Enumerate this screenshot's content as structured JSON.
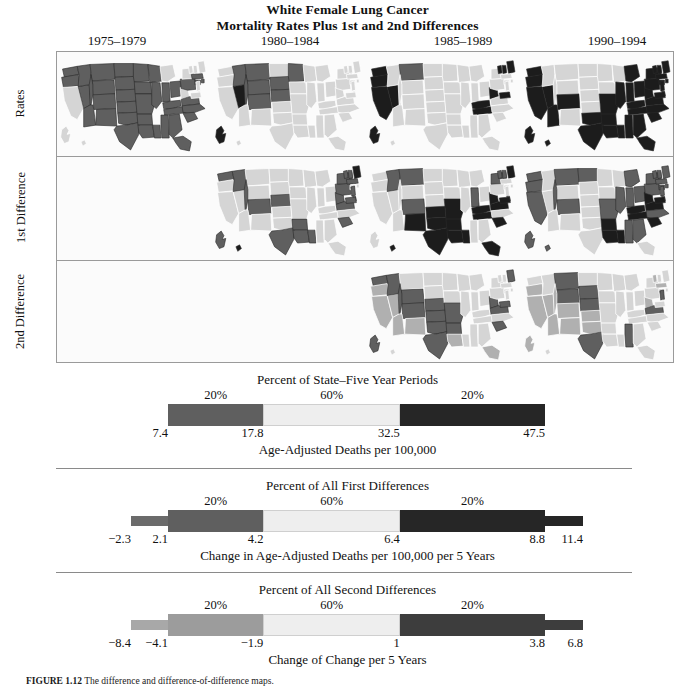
{
  "figure": {
    "title_line1": "White Female Lung Cancer",
    "title_line2": "Mortality Rates Plus 1st and 2nd Differences",
    "caption_label": "FIGURE 1.12",
    "caption_text": "  The difference and difference-of-difference maps."
  },
  "columns": [
    {
      "label": "1975–1979"
    },
    {
      "label": "1980–1984"
    },
    {
      "label": "1985–1989"
    },
    {
      "label": "1990–1994"
    }
  ],
  "rows": [
    {
      "label": "Rates"
    },
    {
      "label": "1st Difference"
    },
    {
      "label": "2nd Difference"
    }
  ],
  "palette": {
    "map_background": "#fbfbfb",
    "panel_border": "#9a9a9a",
    "state_outline": "#ffffff",
    "state_outline_dark": "#2a2a2a",
    "class_very_light": "#e9e9e9",
    "class_light": "#d5d5d5",
    "class_mid_light": "#b0b0b0",
    "class_mid": "#8c8c8c",
    "class_dark": "#5f5f5f",
    "class_very_dark": "#3a3a3a",
    "class_black": "#1c1c1c"
  },
  "legends": [
    {
      "id": "rates",
      "title": "Percent of State–Five Year Periods",
      "footer": "Age-Adjusted Deaths per 100,000",
      "percents": [
        "20%",
        "60%",
        "20%"
      ],
      "ticks": [
        "7.4",
        "17.8",
        "32.5",
        "47.5"
      ],
      "values": [
        7.4,
        17.8,
        32.5,
        47.5
      ],
      "segment_colors": [
        "#5f5f5f",
        "#eeeeee",
        "#262626"
      ],
      "has_tails": false
    },
    {
      "id": "first-difference",
      "title": "Percent of All First Differences",
      "footer": "Change in Age-Adjusted Deaths per 100,000 per 5 Years",
      "percents": [
        "20%",
        "60%",
        "20%"
      ],
      "ticks": [
        "−2.3",
        "2.1",
        "4.2",
        "6.4",
        "8.8",
        "11.4"
      ],
      "values": [
        -2.3,
        2.1,
        4.2,
        6.4,
        8.8,
        11.4
      ],
      "segment_colors": [
        "#5f5f5f",
        "#eeeeee",
        "#262626"
      ],
      "tail_colors": [
        "#6b6b6b",
        "#262626"
      ],
      "has_tails": true
    },
    {
      "id": "second-difference",
      "title": "Percent of All Second Differences",
      "footer": "Change of Change per 5 Years",
      "percents": [
        "20%",
        "60%",
        "20%"
      ],
      "ticks": [
        "−8.4",
        "−4.1",
        "−1.9",
        "1",
        "3.8",
        "6.8"
      ],
      "values": [
        -8.4,
        -4.1,
        -1.9,
        1,
        3.8,
        6.8
      ],
      "segment_colors": [
        "#9c9c9c",
        "#eeeeee",
        "#3d3d3d"
      ],
      "tail_colors": [
        "#a8a8a8",
        "#3d3d3d"
      ],
      "has_tails": true
    }
  ],
  "chart_data": {
    "type": "map",
    "title": "White Female Lung Cancer Mortality Rates Plus 1st and 2nd Differences",
    "grid": {
      "rows": 3,
      "columns": 4
    },
    "row_names": [
      "Rates",
      "1st Difference",
      "2nd Difference"
    ],
    "column_names": [
      "1975–1979",
      "1980–1984",
      "1985–1989",
      "1990–1994"
    ],
    "present_cells": [
      {
        "row": "Rates",
        "columns": [
          "1975–1979",
          "1980–1984",
          "1985–1989",
          "1990–1994"
        ]
      },
      {
        "row": "1st Difference",
        "columns": [
          "1980–1984",
          "1985–1989",
          "1990–1994"
        ]
      },
      {
        "row": "2nd Difference",
        "columns": [
          "1985–1989",
          "1990–1994"
        ]
      }
    ],
    "class_breaks": {
      "rates": [
        7.4,
        17.8,
        32.5,
        47.5
      ],
      "first_difference": [
        -2.3,
        2.1,
        4.2,
        6.4,
        8.8,
        11.4
      ],
      "second_difference": [
        -8.4,
        -4.1,
        -1.9,
        1,
        3.8,
        6.8
      ]
    },
    "class_percentages": [
      20,
      60,
      20
    ],
    "units": {
      "rates": "Age-Adjusted Deaths per 100,000",
      "first_difference": "Change in Age-Adjusted Deaths per 100,000 per 5 Years",
      "second_difference": "Change of Change per 5 Years"
    },
    "shading_levels": [
      0,
      1,
      2,
      3,
      4
    ],
    "maps": [
      {
        "row": 0,
        "col": 0,
        "shades": {
          "WA": 3,
          "OR": 3,
          "CA": 1,
          "NV": 3,
          "ID": 3,
          "MT": 3,
          "WY": 3,
          "UT": 3,
          "CO": 3,
          "AZ": 3,
          "NM": 3,
          "ND": 3,
          "SD": 3,
          "NE": 3,
          "KS": 3,
          "OK": 3,
          "TX": 3,
          "MN": 3,
          "IA": 3,
          "MO": 3,
          "AR": 3,
          "LA": 3,
          "WI": 3,
          "IL": 3,
          "MS": 3,
          "MI": 1,
          "IN": 3,
          "KY": 3,
          "TN": 3,
          "AL": 3,
          "OH": 3,
          "WV": 1,
          "GA": 3,
          "FL": 3,
          "PA": 3,
          "NY": 1,
          "VA": 3,
          "NC": 3,
          "SC": 3,
          "VT": 1,
          "NH": 1,
          "ME": 1,
          "MA": 3,
          "RI": 3,
          "CT": 3,
          "NJ": 1,
          "DE": 1,
          "MD": 1,
          "AK": 1,
          "HI": 1
        }
      },
      {
        "row": 0,
        "col": 1,
        "shades": {
          "WA": 1,
          "OR": 1,
          "CA": 1,
          "NV": 4,
          "ID": 3,
          "MT": 3,
          "WY": 3,
          "UT": 3,
          "CO": 3,
          "AZ": 1,
          "NM": 1,
          "ND": 1,
          "SD": 3,
          "NE": 3,
          "KS": 1,
          "OK": 1,
          "TX": 1,
          "MN": 3,
          "IA": 1,
          "MO": 1,
          "AR": 1,
          "LA": 1,
          "WI": 1,
          "IL": 1,
          "MS": 1,
          "MI": 1,
          "IN": 1,
          "KY": 1,
          "TN": 1,
          "AL": 1,
          "OH": 1,
          "WV": 1,
          "GA": 1,
          "FL": 1,
          "PA": 1,
          "NY": 1,
          "VA": 1,
          "NC": 1,
          "SC": 1,
          "VT": 1,
          "NH": 1,
          "ME": 1,
          "MA": 1,
          "RI": 1,
          "CT": 1,
          "NJ": 1,
          "DE": 1,
          "MD": 1,
          "AK": 4,
          "HI": 1
        }
      },
      {
        "row": 0,
        "col": 2,
        "shades": {
          "WA": 4,
          "OR": 4,
          "CA": 4,
          "NV": 4,
          "ID": 1,
          "MT": 3,
          "WY": 1,
          "UT": 1,
          "CO": 1,
          "AZ": 1,
          "NM": 1,
          "ND": 1,
          "SD": 1,
          "NE": 1,
          "KS": 1,
          "OK": 1,
          "TX": 1,
          "MN": 1,
          "IA": 1,
          "MO": 1,
          "AR": 1,
          "LA": 1,
          "WI": 1,
          "IL": 1,
          "MS": 1,
          "MI": 1,
          "IN": 1,
          "KY": 4,
          "TN": 4,
          "AL": 1,
          "OH": 1,
          "WV": 4,
          "GA": 1,
          "FL": 1,
          "PA": 1,
          "NY": 1,
          "VA": 1,
          "NC": 1,
          "SC": 1,
          "VT": 4,
          "NH": 4,
          "ME": 4,
          "MA": 1,
          "RI": 1,
          "CT": 1,
          "NJ": 1,
          "DE": 1,
          "MD": 4,
          "AK": 4,
          "HI": 1
        }
      },
      {
        "row": 0,
        "col": 3,
        "shades": {
          "WA": 4,
          "OR": 4,
          "CA": 4,
          "NV": 4,
          "ID": 1,
          "MT": 1,
          "WY": 1,
          "UT": 1,
          "CO": 4,
          "AZ": 4,
          "NM": 1,
          "ND": 1,
          "SD": 1,
          "NE": 1,
          "KS": 1,
          "OK": 4,
          "TX": 4,
          "MN": 1,
          "IA": 1,
          "MO": 4,
          "AR": 4,
          "LA": 4,
          "WI": 1,
          "IL": 4,
          "MS": 4,
          "MI": 4,
          "IN": 4,
          "KY": 4,
          "TN": 4,
          "AL": 4,
          "OH": 4,
          "WV": 4,
          "GA": 4,
          "FL": 4,
          "PA": 4,
          "NY": 4,
          "VA": 4,
          "NC": 4,
          "SC": 4,
          "VT": 4,
          "NH": 4,
          "ME": 4,
          "MA": 4,
          "RI": 4,
          "CT": 4,
          "NJ": 4,
          "DE": 4,
          "MD": 4,
          "AK": 4,
          "HI": 4
        }
      },
      {
        "row": 1,
        "col": 1,
        "shades": {
          "WA": 3,
          "OR": 1,
          "CA": 1,
          "NV": 1,
          "ID": 3,
          "MT": 1,
          "WY": 1,
          "UT": 3,
          "CO": 3,
          "AZ": 1,
          "NM": 1,
          "ND": 1,
          "SD": 1,
          "NE": 3,
          "KS": 1,
          "OK": 1,
          "TX": 3,
          "MN": 1,
          "IA": 1,
          "MO": 1,
          "AR": 3,
          "LA": 3,
          "WI": 1,
          "IL": 1,
          "MS": 3,
          "MI": 1,
          "IN": 1,
          "KY": 1,
          "TN": 1,
          "AL": 1,
          "OH": 1,
          "WV": 3,
          "GA": 1,
          "FL": 1,
          "PA": 3,
          "NY": 3,
          "VA": 3,
          "NC": 1,
          "SC": 3,
          "VT": 3,
          "NH": 3,
          "ME": 4,
          "MA": 3,
          "RI": 1,
          "CT": 1,
          "NJ": 3,
          "DE": 3,
          "MD": 3,
          "AK": 3,
          "HI": 4
        }
      },
      {
        "row": 1,
        "col": 2,
        "shades": {
          "WA": 1,
          "OR": 1,
          "CA": 1,
          "NV": 1,
          "ID": 3,
          "MT": 3,
          "WY": 1,
          "UT": 1,
          "CO": 3,
          "AZ": 1,
          "NM": 4,
          "ND": 1,
          "SD": 1,
          "NE": 1,
          "KS": 4,
          "OK": 4,
          "TX": 4,
          "MN": 1,
          "IA": 1,
          "MO": 4,
          "AR": 4,
          "LA": 4,
          "WI": 1,
          "IL": 1,
          "MS": 4,
          "MI": 1,
          "IN": 3,
          "KY": 4,
          "TN": 4,
          "AL": 1,
          "OH": 1,
          "WV": 4,
          "GA": 1,
          "FL": 4,
          "PA": 1,
          "NY": 3,
          "VA": 4,
          "NC": 1,
          "SC": 4,
          "VT": 3,
          "NH": 3,
          "ME": 4,
          "MA": 1,
          "RI": 1,
          "CT": 1,
          "NJ": 1,
          "DE": 3,
          "MD": 4,
          "AK": 1,
          "HI": 4
        }
      },
      {
        "row": 1,
        "col": 3,
        "shades": {
          "WA": 3,
          "OR": 3,
          "CA": 3,
          "NV": 1,
          "ID": 1,
          "MT": 3,
          "WY": 1,
          "UT": 3,
          "CO": 3,
          "AZ": 1,
          "NM": 1,
          "ND": 3,
          "SD": 1,
          "NE": 1,
          "KS": 1,
          "OK": 1,
          "TX": 1,
          "MN": 1,
          "IA": 1,
          "MO": 3,
          "AR": 4,
          "LA": 4,
          "WI": 1,
          "IL": 3,
          "MS": 4,
          "MI": 3,
          "IN": 3,
          "KY": 4,
          "TN": 4,
          "AL": 3,
          "OH": 3,
          "WV": 4,
          "GA": 3,
          "FL": 1,
          "PA": 3,
          "NY": 3,
          "VA": 4,
          "NC": 3,
          "SC": 4,
          "VT": 3,
          "NH": 3,
          "ME": 3,
          "MA": 3,
          "RI": 3,
          "CT": 3,
          "NJ": 3,
          "DE": 3,
          "MD": 4,
          "AK": 3,
          "HI": 3
        }
      },
      {
        "row": 2,
        "col": 2,
        "shades": {
          "WA": 3,
          "OR": 2,
          "CA": 2,
          "NV": 2,
          "ID": 3,
          "MT": 1,
          "WY": 3,
          "UT": 3,
          "CO": 3,
          "AZ": 2,
          "NM": 2,
          "ND": 1,
          "SD": 1,
          "NE": 3,
          "KS": 3,
          "OK": 3,
          "TX": 3,
          "MN": 1,
          "IA": 1,
          "MO": 3,
          "AR": 3,
          "LA": 2,
          "WI": 1,
          "IL": 1,
          "MS": 1,
          "MI": 1,
          "IN": 1,
          "KY": 1,
          "TN": 1,
          "AL": 1,
          "OH": 1,
          "WV": 3,
          "GA": 1,
          "FL": 2,
          "PA": 1,
          "NY": 1,
          "VA": 3,
          "NC": 1,
          "SC": 3,
          "VT": 1,
          "NH": 1,
          "ME": 3,
          "MA": 1,
          "RI": 1,
          "CT": 1,
          "NJ": 1,
          "DE": 1,
          "MD": 3,
          "AK": 3,
          "HI": 1
        }
      },
      {
        "row": 2,
        "col": 3,
        "shades": {
          "WA": 1,
          "OR": 2,
          "CA": 2,
          "NV": 2,
          "ID": 1,
          "MT": 3,
          "WY": 3,
          "UT": 2,
          "CO": 2,
          "AZ": 2,
          "NM": 2,
          "ND": 1,
          "SD": 3,
          "NE": 3,
          "KS": 2,
          "OK": 2,
          "TX": 3,
          "MN": 1,
          "IA": 1,
          "MO": 1,
          "AR": 1,
          "LA": 1,
          "WI": 1,
          "IL": 1,
          "MS": 1,
          "MI": 1,
          "IN": 1,
          "KY": 1,
          "TN": 1,
          "AL": 3,
          "OH": 1,
          "WV": 2,
          "GA": 1,
          "FL": 1,
          "PA": 1,
          "NY": 1,
          "VA": 3,
          "NC": 1,
          "SC": 1,
          "VT": 2,
          "NH": 1,
          "ME": 1,
          "MA": 2,
          "RI": 1,
          "CT": 2,
          "NJ": 3,
          "DE": 1,
          "MD": 1,
          "AK": 2,
          "HI": 1
        }
      }
    ]
  }
}
